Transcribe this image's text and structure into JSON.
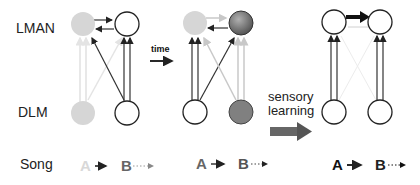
{
  "labels": {
    "lman": "LMAN",
    "dlm": "DLM",
    "song": "Song",
    "time": "time",
    "sensory_line1": "sensory",
    "sensory_line2": "learning"
  },
  "panels": [
    {
      "id": "stage-1",
      "song": {
        "a": "A",
        "b": "B",
        "a_color": "#d8d8d8",
        "b_color": "#666666"
      },
      "nodes": {
        "lman_left": "#d6d6d6",
        "lman_right": "#ffffff",
        "dlm_left": "#d6d6d6",
        "dlm_right": "#ffffff"
      }
    },
    {
      "id": "stage-2",
      "song": {
        "a": "A",
        "b": "B",
        "a_color": "#666666",
        "b_color": "#555555"
      },
      "nodes": {
        "lman_left": "#d6d6d6",
        "lman_right": "#777777",
        "dlm_left": "#ffffff",
        "dlm_right": "#808080"
      }
    },
    {
      "id": "stage-3",
      "song": {
        "a": "A",
        "b": "B",
        "a_color": "#111111",
        "b_color": "#222222"
      },
      "nodes": {
        "lman_left": "#ffffff",
        "lman_right": "#ffffff",
        "dlm_left": "#ffffff",
        "dlm_right": "#ffffff"
      }
    }
  ]
}
